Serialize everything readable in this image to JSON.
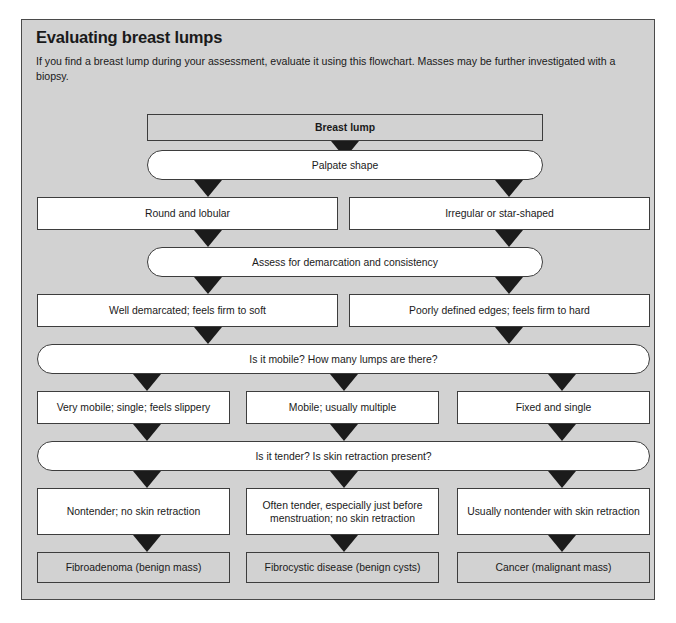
{
  "header": {
    "title": "Evaluating breast lumps",
    "intro": "If you find a breast lump during your assessment, evaluate it using this flowchart. Masses may be further investigated with a biopsy."
  },
  "flowchart": {
    "type": "flowchart",
    "orientation": "top-down",
    "nodes": [
      {
        "id": "n0",
        "label": "Breast lump",
        "shape": "rect-shaded",
        "emphasis": "bold"
      },
      {
        "id": "n1",
        "label": "Palpate shape",
        "shape": "pill"
      },
      {
        "id": "n2",
        "label": "Round and lobular",
        "shape": "rect"
      },
      {
        "id": "n3",
        "label": "Irregular or star-shaped",
        "shape": "rect"
      },
      {
        "id": "n4",
        "label": "Assess for demarcation and consistency",
        "shape": "pill"
      },
      {
        "id": "n5",
        "label": "Well demarcated; feels firm to soft",
        "shape": "rect"
      },
      {
        "id": "n6",
        "label": "Poorly defined edges; feels firm to hard",
        "shape": "rect"
      },
      {
        "id": "n7",
        "label": "Is it mobile? How many lumps are there?",
        "shape": "pill"
      },
      {
        "id": "n8",
        "label": "Very mobile; single; feels slippery",
        "shape": "rect"
      },
      {
        "id": "n9",
        "label": "Mobile; usually multiple",
        "shape": "rect"
      },
      {
        "id": "n10",
        "label": "Fixed and single",
        "shape": "rect"
      },
      {
        "id": "n11",
        "label": "Is it tender? Is skin retraction present?",
        "shape": "pill"
      },
      {
        "id": "n12",
        "label": "Nontender; no skin retraction",
        "shape": "rect"
      },
      {
        "id": "n13",
        "label": "Often tender, especially just before menstruation; no skin retraction",
        "shape": "rect"
      },
      {
        "id": "n14",
        "label": "Usually nontender with skin retraction",
        "shape": "rect"
      },
      {
        "id": "n15",
        "label": "Fibroadenoma (benign mass)",
        "shape": "rect-shaded"
      },
      {
        "id": "n16",
        "label": "Fibrocystic disease (benign cysts)",
        "shape": "rect-shaded"
      },
      {
        "id": "n17",
        "label": "Cancer (malignant mass)",
        "shape": "rect-shaded"
      }
    ],
    "edges": [
      {
        "from": "n0",
        "to": "n1"
      },
      {
        "from": "n1",
        "to": "n2"
      },
      {
        "from": "n1",
        "to": "n3"
      },
      {
        "from": "n2",
        "to": "n4"
      },
      {
        "from": "n3",
        "to": "n4"
      },
      {
        "from": "n4",
        "to": "n5"
      },
      {
        "from": "n4",
        "to": "n6"
      },
      {
        "from": "n5",
        "to": "n7"
      },
      {
        "from": "n6",
        "to": "n7"
      },
      {
        "from": "n7",
        "to": "n8"
      },
      {
        "from": "n7",
        "to": "n9"
      },
      {
        "from": "n7",
        "to": "n10"
      },
      {
        "from": "n8",
        "to": "n11"
      },
      {
        "from": "n9",
        "to": "n11"
      },
      {
        "from": "n10",
        "to": "n11"
      },
      {
        "from": "n11",
        "to": "n12"
      },
      {
        "from": "n11",
        "to": "n13"
      },
      {
        "from": "n11",
        "to": "n14"
      },
      {
        "from": "n12",
        "to": "n15"
      },
      {
        "from": "n13",
        "to": "n16"
      },
      {
        "from": "n14",
        "to": "n17"
      }
    ]
  },
  "colors": {
    "panel_background": "#d2d2d2",
    "panel_border": "#4a4a4a",
    "node_border": "#3d3d3d",
    "node_fill": "#ffffff",
    "node_fill_shaded": "#d2d2d2",
    "arrow": "#1b1b1b",
    "text": "#1a1a1a"
  }
}
